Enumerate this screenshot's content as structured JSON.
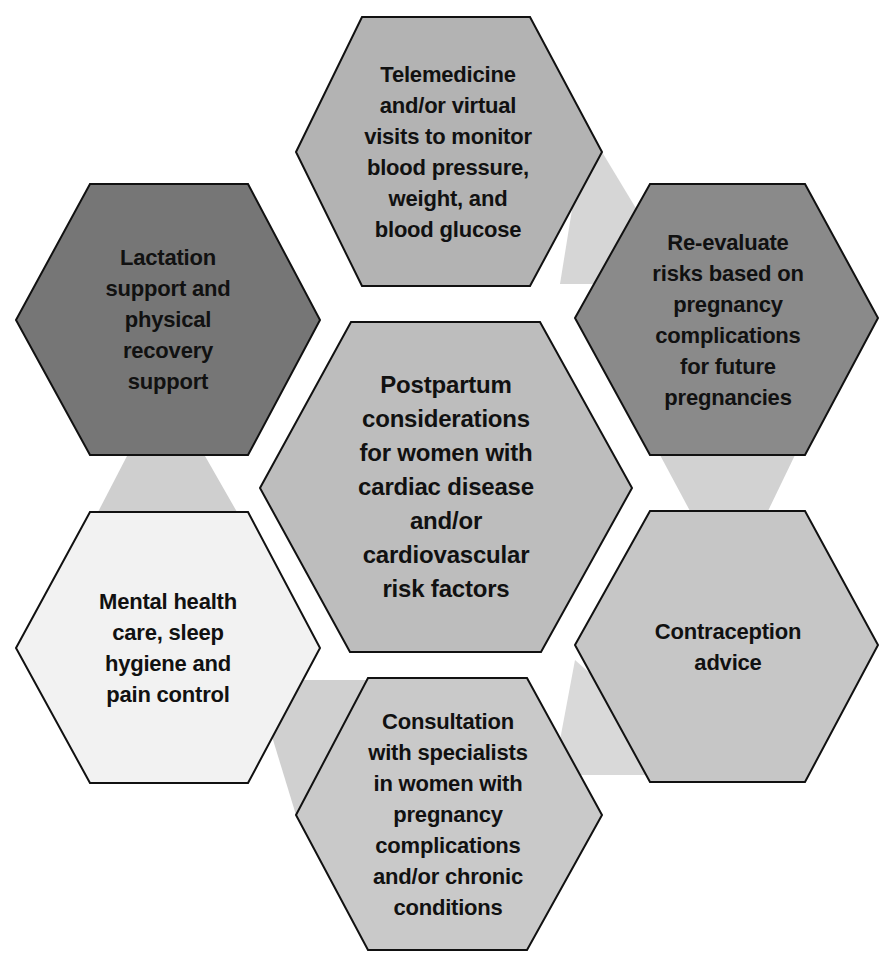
{
  "diagram": {
    "type": "hexagon-cluster",
    "colors": {
      "connector": "#d4d4d4",
      "outline": "#111111",
      "text": "#111111"
    },
    "center": {
      "label": "Postpartum\nconsiderations\nfor women with\ncardiac disease\nand/or\ncardiovascular\nrisk factors",
      "fill": "#bdbdbd"
    },
    "nodes": [
      {
        "id": "top",
        "label": "Telemedicine\nand/or virtual\nvisits to monitor\nblood pressure,\nweight, and\nblood glucose",
        "fill": "#b3b3b3"
      },
      {
        "id": "upper-right",
        "label": "Re-evaluate\nrisks based on\npregnancy\ncomplications\nfor future\npregnancies",
        "fill": "#8a8a8a"
      },
      {
        "id": "lower-right",
        "label": "Contraception\nadvice",
        "fill": "#c6c6c6"
      },
      {
        "id": "bottom",
        "label": "Consultation\nwith specialists\nin women with\npregnancy\ncomplications\nand/or chronic\nconditions",
        "fill": "#c9c9c9"
      },
      {
        "id": "lower-left",
        "label": "Mental health\ncare, sleep\nhygiene and\npain control",
        "fill": "#f2f2f2"
      },
      {
        "id": "upper-left",
        "label": "Lactation\nsupport and\nphysical\nrecovery\nsupport",
        "fill": "#767676"
      }
    ]
  }
}
